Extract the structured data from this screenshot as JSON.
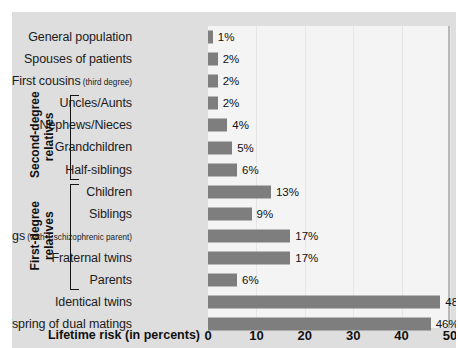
{
  "chart_data": {
    "type": "bar",
    "orientation": "horizontal",
    "title": "",
    "xlabel": "Lifetime risk (in percents)",
    "ylabel": "",
    "xlim": [
      0,
      50
    ],
    "xticks": [
      0,
      10,
      20,
      30,
      40,
      50
    ],
    "xtick_labels": [
      "0",
      "10",
      "20",
      "30",
      "40",
      "50"
    ],
    "grid": true,
    "legend": "none",
    "value_suffix": "%",
    "bar_color": "#7e7e7e",
    "plot_background": "#f4f4f4",
    "panel_background": "#dedede",
    "categories": [
      "General population",
      "Spouses of patients",
      "First cousins",
      "Uncles/Aunts",
      "Nephews/Nieces",
      "Grandchildren",
      "Half-siblings",
      "Children",
      "Siblings",
      "Siblings",
      "Fraternal twins",
      "Parents",
      "Identical twins",
      "Offspring of dual matings"
    ],
    "category_notes": [
      "",
      "",
      "(third degree)",
      "",
      "",
      "",
      "",
      "",
      "",
      "(with 1 schizophrenic parent)",
      "",
      "",
      "",
      ""
    ],
    "values": [
      1,
      2,
      2,
      2,
      4,
      5,
      6,
      13,
      9,
      17,
      17,
      6,
      48,
      46
    ],
    "value_labels": [
      "1%",
      "2%",
      "2%",
      "2%",
      "4%",
      "5%",
      "6%",
      "13%",
      "9%",
      "17%",
      "17%",
      "6%",
      "48%",
      "46%"
    ],
    "groups": [
      {
        "label_line1": "Second-degree",
        "label_line2": "relatives",
        "first_index": 3,
        "last_index": 6
      },
      {
        "label_line1": "First-degree",
        "label_line2": "relatives",
        "first_index": 7,
        "last_index": 11
      }
    ]
  }
}
